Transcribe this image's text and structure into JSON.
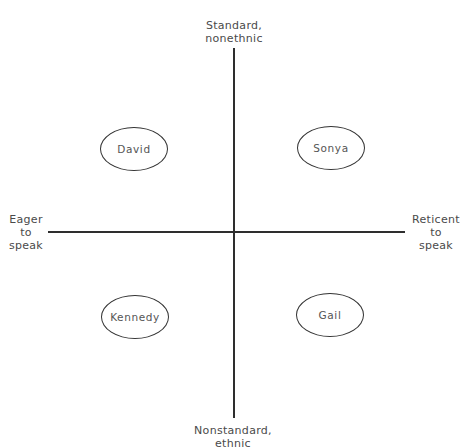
{
  "axes": {
    "vertical": {
      "top_label": [
        "Standard,",
        "nonethnic"
      ],
      "bottom_label": [
        "Nonstandard,",
        "ethnic"
      ]
    },
    "horizontal": {
      "left_label": [
        "Eager",
        "to",
        "speak"
      ],
      "right_label": [
        "Reticent",
        "to",
        "speak"
      ]
    }
  },
  "nodes": [
    {
      "label": "David",
      "quadrant": "top-left"
    },
    {
      "label": "Sonya",
      "quadrant": "top-right"
    },
    {
      "label": "Kennedy",
      "quadrant": "bottom-left"
    },
    {
      "label": "Gail",
      "quadrant": "bottom-right"
    }
  ],
  "colors": {
    "line": "#2e2e2e",
    "text": "#4a4a4a",
    "background": "#ffffff"
  }
}
